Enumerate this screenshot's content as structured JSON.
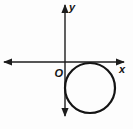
{
  "figure": {
    "type": "coordinate-geometry-diagram",
    "background_color": "#fdfdfd",
    "stroke_color": "#1c1c1c",
    "labels": {
      "origin": "O",
      "x_axis": "x",
      "y_axis": "y"
    },
    "axes": {
      "x_axis": {
        "y": 62,
        "x1": 4,
        "x2": 124,
        "arrows": "both-ends"
      },
      "y_axis": {
        "x": 65,
        "y1": 5,
        "y2": 116,
        "arrows": "both-ends"
      }
    },
    "circle": {
      "cx": 90,
      "cy": 88,
      "r": 25,
      "position": "quadrant-IV",
      "tangent_to": "x-axis and y-axis"
    }
  }
}
